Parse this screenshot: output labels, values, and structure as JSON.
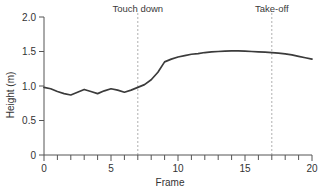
{
  "chart_data": {
    "type": "line",
    "title": "",
    "xlabel": "Frame",
    "ylabel": "Height (m)",
    "xlim": [
      0,
      20
    ],
    "ylim": [
      0,
      2.0
    ],
    "grid": false,
    "legend": null,
    "x_ticks_major": [
      0,
      5,
      10,
      15,
      20
    ],
    "x_tick_labels": [
      "0",
      "5",
      "10",
      "15",
      "20"
    ],
    "x_ticks_minor": [
      1,
      2,
      3,
      4,
      6,
      7,
      8,
      9,
      11,
      12,
      13,
      14,
      16,
      17,
      18,
      19
    ],
    "y_ticks": [
      0,
      0.5,
      1.0,
      1.5,
      2.0
    ],
    "y_tick_labels": [
      "0",
      "0.5",
      "1.0",
      "1.5",
      "2.0"
    ],
    "line_color": "#3b3b3b",
    "annotation_color": "#b0b0b0",
    "series": [
      {
        "name": "Height",
        "x": [
          0,
          0.5,
          1,
          1.5,
          2,
          2.5,
          3,
          3.5,
          4,
          4.5,
          5,
          5.5,
          6,
          6.5,
          7,
          7.5,
          8,
          8.5,
          9,
          9.5,
          10,
          10.5,
          11,
          11.5,
          12,
          12.5,
          13,
          13.5,
          14,
          14.5,
          15,
          15.5,
          16,
          16.5,
          17,
          17.5,
          18,
          18.5,
          19,
          19.5,
          20
        ],
        "values": [
          0.98,
          0.96,
          0.92,
          0.89,
          0.87,
          0.91,
          0.95,
          0.92,
          0.89,
          0.93,
          0.96,
          0.94,
          0.91,
          0.94,
          0.98,
          1.02,
          1.09,
          1.2,
          1.35,
          1.39,
          1.42,
          1.44,
          1.46,
          1.47,
          1.485,
          1.495,
          1.5,
          1.505,
          1.51,
          1.51,
          1.505,
          1.5,
          1.495,
          1.49,
          1.485,
          1.475,
          1.465,
          1.45,
          1.43,
          1.41,
          1.39
        ]
      }
    ],
    "annotations": [
      {
        "label": "Touch down",
        "x": 7,
        "type": "vline-dashed"
      },
      {
        "label": "Take-off",
        "x": 17,
        "type": "vline-dashed"
      }
    ]
  }
}
